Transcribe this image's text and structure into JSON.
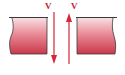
{
  "diagram": {
    "labels": {
      "left_arrow": "V",
      "right_arrow": "V"
    },
    "colors": {
      "block_top": "#f7dadd",
      "block_bottom": "#c9384a",
      "arrow": "#d5263a",
      "label": "#c41e2e",
      "outline": "#3a3a3a"
    },
    "arrows": [
      {
        "name": "left-velocity-arrow",
        "direction": "down"
      },
      {
        "name": "right-velocity-arrow",
        "direction": "up"
      }
    ]
  }
}
